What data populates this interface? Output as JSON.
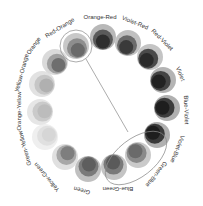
{
  "diagram": {
    "title": "",
    "center": [
      101,
      103
    ],
    "connector": {
      "from": [
        86,
        59
      ],
      "to": [
        128,
        132
      ],
      "color": "#888888"
    },
    "highlights": [
      {
        "name": "red-orange-highlight",
        "type": "circle",
        "cx": 76,
        "cy": 46,
        "r": 16
      },
      {
        "name": "green-blue-group-highlight",
        "type": "ellipse",
        "cx": 136,
        "cy": 158,
        "rx": 36,
        "ry": 19,
        "rotate": -38
      }
    ],
    "segments": [
      {
        "label": "Red-Orange",
        "cx": 76,
        "cy": 46,
        "outer": "#c8c8c8",
        "mid": "#8e8e8e",
        "inner": "#6a6a6a",
        "lx": 60,
        "ly": 28,
        "rot": -32
      },
      {
        "label": "Orange-Red",
        "cx": 103,
        "cy": 37,
        "outer": "#b8b8b8",
        "mid": "#5a5a5a",
        "inner": "#2e2e2e",
        "lx": 100,
        "ly": 17,
        "rot": 0
      },
      {
        "label": "Violet-Red",
        "cx": 128,
        "cy": 43,
        "outer": "#c0c0c0",
        "mid": "#6a6a6a",
        "inner": "#3a3a3a",
        "lx": 135,
        "ly": 23,
        "rot": 22
      },
      {
        "label": "Red-Violet",
        "cx": 150,
        "cy": 57,
        "outer": "#c4c4c4",
        "mid": "#4a4a4a",
        "inner": "#2a2a2a",
        "lx": 162,
        "ly": 40,
        "rot": 45
      },
      {
        "label": "Violet",
        "cx": 163,
        "cy": 80,
        "outer": "#b4b4b4",
        "mid": "#444444",
        "inner": "#222222",
        "lx": 180,
        "ly": 74,
        "rot": 68
      },
      {
        "label": "Blue-Violet",
        "cx": 167,
        "cy": 108,
        "outer": "#b0b0b0",
        "mid": "#3c3c3c",
        "inner": "#1e1e1e",
        "lx": 186,
        "ly": 110,
        "rot": 88
      },
      {
        "label": "Violet-Blue",
        "cx": 157,
        "cy": 135,
        "outer": "#b0b0b0",
        "mid": "#3a3a3a",
        "inner": "#1e1e1e",
        "lx": 177,
        "ly": 149,
        "rot": 112
      },
      {
        "label": "Green-Blue",
        "cx": 138,
        "cy": 155,
        "outer": "#cacaca",
        "mid": "#8a8a8a",
        "inner": "#6a6a6a",
        "lx": 156,
        "ly": 174,
        "rot": 128
      },
      {
        "label": "Blue-Green",
        "cx": 114,
        "cy": 167,
        "outer": "#c4c4c4",
        "mid": "#7a7a7a",
        "inner": "#5a5a5a",
        "lx": 118,
        "ly": 189,
        "rot": 180
      },
      {
        "label": "Green",
        "cx": 88,
        "cy": 169,
        "outer": "#c0c0c0",
        "mid": "#7a7a7a",
        "inner": "#5e5e5e",
        "lx": 82,
        "ly": 190,
        "rot": 195
      },
      {
        "label": "Yellow-Green",
        "cx": 65,
        "cy": 157,
        "outer": "#e0e0e0",
        "mid": "#a8a8a8",
        "inner": "#7e7e7e",
        "lx": 47,
        "ly": 177,
        "rot": 230
      },
      {
        "label": "Green-Yellow",
        "cx": 45,
        "cy": 137,
        "outer": "#efefef",
        "mid": "#e0e0e0",
        "inner": "#d6d6d6",
        "lx": 25,
        "ly": 148,
        "rot": 255
      },
      {
        "label": "Orange-Yellow",
        "cx": 40,
        "cy": 112,
        "outer": "#e6e6e6",
        "mid": "#cacaca",
        "inner": "#bcbcbc",
        "lx": 19,
        "ly": 111,
        "rot": 270
      },
      {
        "label": "Yellow-Orange",
        "cx": 42,
        "cy": 84,
        "outer": "#e2e2e2",
        "mid": "#c6c6c6",
        "inner": "#b0b0b0",
        "lx": 22,
        "ly": 73,
        "rot": 285
      },
      {
        "label": "Orange",
        "cx": 55,
        "cy": 62,
        "outer": "#dadada",
        "mid": "#a0a0a0",
        "inner": "#6e6e6e",
        "lx": 34,
        "ly": 46,
        "rot": 305
      }
    ]
  }
}
